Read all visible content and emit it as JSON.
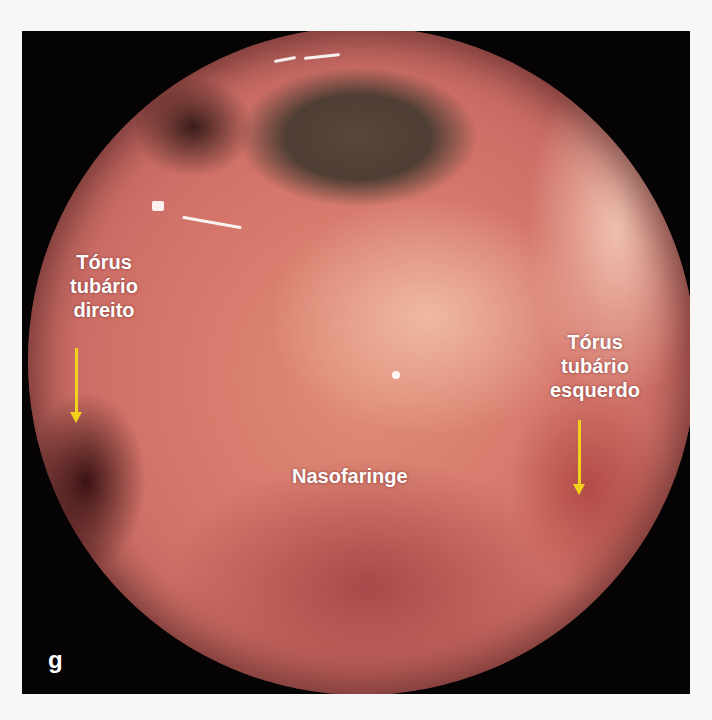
{
  "figure": {
    "panel_letter": "g",
    "labels": {
      "right_torus": [
        "Tórus",
        "tubário",
        "direito"
      ],
      "left_torus": [
        "Tórus",
        "tubário",
        "esquerdo"
      ],
      "nasopharynx": "Nasofaringe"
    },
    "colors": {
      "frame": "#050303",
      "arrow": "#f2d21a",
      "label_text": "#ffffff",
      "page_background": "#f7f7f5"
    }
  }
}
